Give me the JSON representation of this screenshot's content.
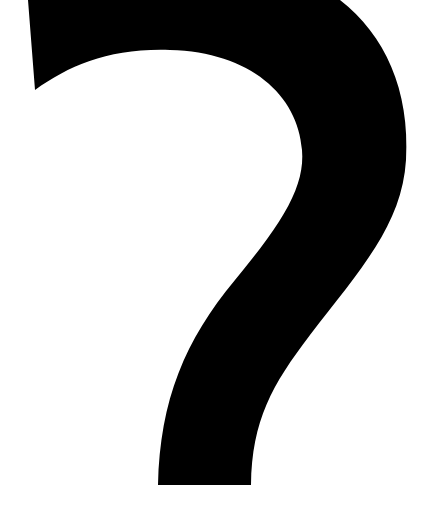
{
  "image": {
    "subject": "question-mark glyph",
    "label": "?",
    "colors": {
      "background": "#ffffff",
      "glyph": "#000000"
    }
  }
}
